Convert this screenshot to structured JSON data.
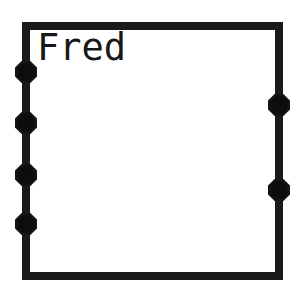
{
  "canvas": {
    "width": 305,
    "height": 295,
    "background_color": "#ffffff"
  },
  "node": {
    "title": "Fred",
    "border_color": "#1a1a1a",
    "fill_color": "#ffffff",
    "border_width_px": 8,
    "bounds": {
      "x": 22,
      "y": 22,
      "width": 261,
      "height": 258
    }
  },
  "ports": {
    "marker_color": "#141414",
    "marker_shape": "octagon",
    "left": [
      {
        "id": "left-port-1",
        "x": 26,
        "y": 72
      },
      {
        "id": "left-port-2",
        "x": 26,
        "y": 123
      },
      {
        "id": "left-port-3",
        "x": 26,
        "y": 175
      },
      {
        "id": "left-port-4",
        "x": 26,
        "y": 224
      }
    ],
    "right": [
      {
        "id": "right-port-1",
        "x": 279,
        "y": 105
      },
      {
        "id": "right-port-2",
        "x": 279,
        "y": 190
      }
    ]
  }
}
